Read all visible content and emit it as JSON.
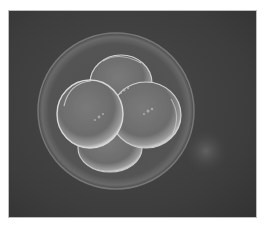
{
  "image": {
    "subject": "four-cell embryo (micrograph)",
    "alt": "Grayscale micrograph of a four-cell stage embryo inside a translucent zona pellucida on a dark background",
    "colors": {
      "background": "#3e3e3e",
      "frame_border": "#bdbdbd",
      "zona": "#8a8a8a",
      "cell_fill": "#6f6f6f",
      "cell_highlight": "#d6d6d6",
      "page": "#ffffff"
    }
  },
  "caption": {
    "text": ""
  }
}
